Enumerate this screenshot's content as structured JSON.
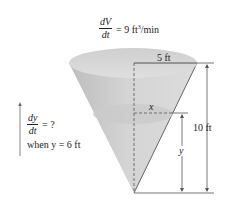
{
  "figure": {
    "type": "related-rates-cone",
    "rate_given": {
      "numerator": "dV",
      "denominator": "dt",
      "equals": "= 9 ft",
      "exponent": "3",
      "unit_tail": "/min"
    },
    "rate_asked": {
      "numerator": "dy",
      "denominator": "dt",
      "equals": "= ?",
      "condition": "when y = 6 ft"
    },
    "dimensions": {
      "radius_label": "5 ft",
      "height_label": "10 ft",
      "water_radius_label": "x",
      "water_height_label": "y"
    },
    "colors": {
      "cone_fill": "#c9c9c9",
      "cone_top": "#d8d8d8",
      "water_surface": "#cfcfcf",
      "line": "#444444",
      "text": "#222222"
    }
  }
}
